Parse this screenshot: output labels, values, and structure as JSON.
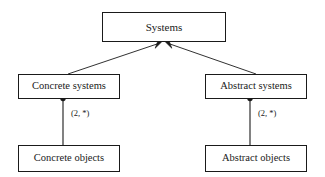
{
  "diagram": {
    "type": "uml-class-diagram",
    "background_color": "#ffffff",
    "stroke_color": "#1a1a1a",
    "nodes": {
      "systems": "Systems",
      "concrete_systems": "Concrete systems",
      "abstract_systems": "Abstract systems",
      "concrete_objects": "Concrete objects",
      "abstract_objects": "Abstract objects"
    },
    "edges": {
      "concrete_systems_to_systems": {
        "kind": "generalization",
        "label": ""
      },
      "abstract_systems_to_systems": {
        "kind": "generalization",
        "label": ""
      },
      "concrete_systems_to_concrete_objects": {
        "kind": "composition",
        "label": "(2, *)"
      },
      "abstract_systems_to_abstract_objects": {
        "kind": "composition",
        "label": "(2, *)"
      }
    }
  }
}
